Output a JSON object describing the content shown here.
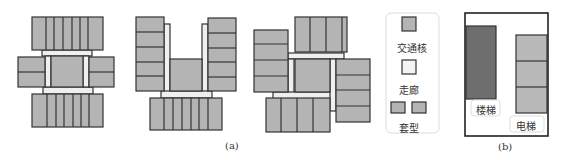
{
  "figure": {
    "caption_a": "(a)",
    "caption_b": "(b)"
  },
  "legend": {
    "items": [
      {
        "label": "交通核",
        "swatch": "core"
      },
      {
        "label": "走廊",
        "swatch": "corridor"
      },
      {
        "label": "套型",
        "swatch": "unit"
      }
    ]
  },
  "detail_b": {
    "stair_label": "楼梯",
    "elevator_label": "电梯"
  },
  "colors": {
    "unit_fill": "#b4b4b4",
    "core_fill": "#b4b4b4",
    "corridor_fill": "#efefef",
    "stair_fill": "#6e6e6e",
    "elevator_fill": "#b9b9b9",
    "stroke": "#333333"
  }
}
